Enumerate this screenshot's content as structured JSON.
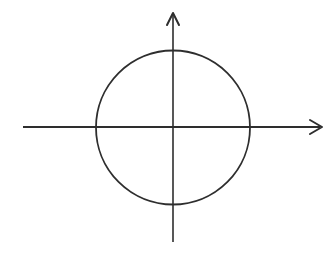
{
  "diagram": {
    "type": "circle-on-cartesian-axes",
    "background": "#ffffff",
    "stroke_color": "#2e2e2e",
    "x_axis": {
      "x1": 23,
      "y1": 127,
      "x2": 320,
      "y2": 127,
      "arrow": "end",
      "stroke_width": 2
    },
    "y_axis": {
      "x1": 173,
      "y1": 242,
      "x2": 173,
      "y2": 14,
      "arrow": "end",
      "stroke_width": 1.6
    },
    "circle": {
      "cx": 173,
      "cy": 127.5,
      "r": 77,
      "stroke_width": 1.8
    },
    "labels": []
  }
}
